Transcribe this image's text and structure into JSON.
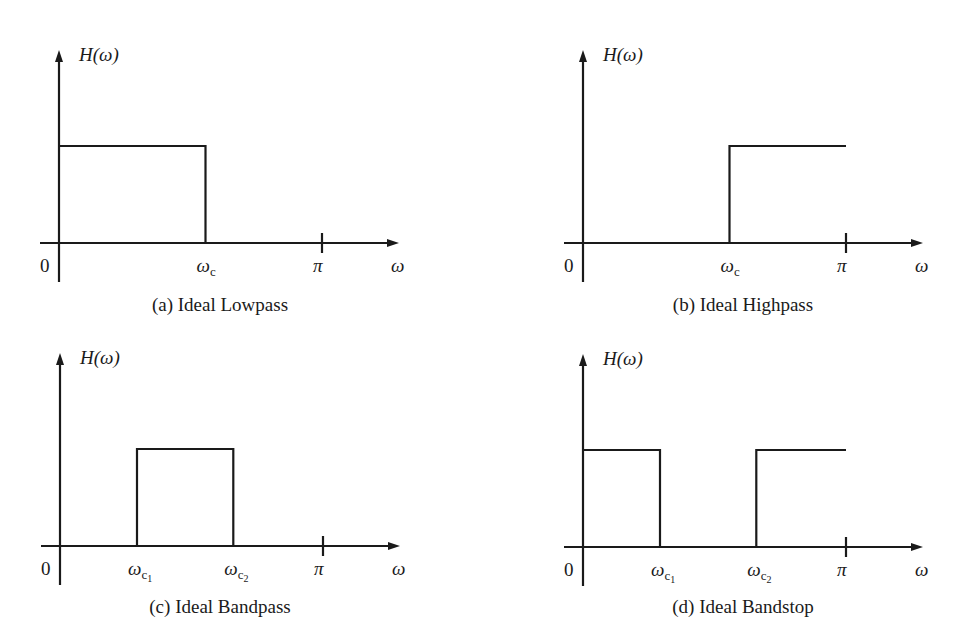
{
  "chart_data": [
    {
      "id": "a",
      "type": "line",
      "title": "(a) Ideal Lowpass",
      "ylabel": "H(ω)",
      "xlabel": "ω",
      "origin_label": "0",
      "xlim": [
        0,
        3.6
      ],
      "ylim": [
        0,
        1.25
      ],
      "ticks": [
        {
          "label": "ω",
          "sub": "c",
          "subsub": "",
          "x": 1.75
        },
        {
          "label": "π",
          "sub": "",
          "subsub": "",
          "x": 3.1416,
          "tick_mark": true
        }
      ],
      "segments": [
        [
          0,
          1
        ],
        [
          1.75,
          1
        ],
        [
          1.75,
          0
        ]
      ]
    },
    {
      "id": "b",
      "type": "line",
      "title": "(b) Ideal Highpass",
      "ylabel": "H(ω)",
      "xlabel": "ω",
      "origin_label": "0",
      "xlim": [
        0,
        3.6
      ],
      "ylim": [
        0,
        1.25
      ],
      "ticks": [
        {
          "label": "ω",
          "sub": "c",
          "subsub": "",
          "x": 1.75
        },
        {
          "label": "π",
          "sub": "",
          "subsub": "",
          "x": 3.1416,
          "tick_mark": true
        }
      ],
      "segments": [
        [
          1.75,
          0
        ],
        [
          1.75,
          1
        ],
        [
          3.1416,
          1
        ]
      ]
    },
    {
      "id": "c",
      "type": "line",
      "title": "(c) Ideal Bandpass",
      "ylabel": "H(ω)",
      "xlabel": "ω",
      "origin_label": "0",
      "xlim": [
        0,
        3.6
      ],
      "ylim": [
        0,
        1.25
      ],
      "ticks": [
        {
          "label": "ω",
          "sub": "c",
          "subsub": "1",
          "x": 0.92
        },
        {
          "label": "ω",
          "sub": "c",
          "subsub": "2",
          "x": 2.07
        },
        {
          "label": "π",
          "sub": "",
          "subsub": "",
          "x": 3.1416,
          "tick_mark": true
        }
      ],
      "segments": [
        [
          0.92,
          0
        ],
        [
          0.92,
          1
        ],
        [
          2.07,
          1
        ],
        [
          2.07,
          0
        ]
      ]
    },
    {
      "id": "d",
      "type": "line",
      "title": "(d) Ideal Bandstop",
      "ylabel": "H(ω)",
      "xlabel": "ω",
      "origin_label": "0",
      "xlim": [
        0,
        3.6
      ],
      "ylim": [
        0,
        1.25
      ],
      "ticks": [
        {
          "label": "ω",
          "sub": "c",
          "subsub": "1",
          "x": 0.92
        },
        {
          "label": "ω",
          "sub": "c",
          "subsub": "2",
          "x": 2.07
        },
        {
          "label": "π",
          "sub": "",
          "subsub": "",
          "x": 3.1416,
          "tick_mark": true
        }
      ],
      "segments": [
        [
          0,
          1
        ],
        [
          0.92,
          1
        ],
        [
          0.92,
          0
        ],
        "break",
        [
          2.07,
          0
        ],
        [
          2.07,
          1
        ],
        [
          3.1416,
          1
        ]
      ]
    }
  ]
}
